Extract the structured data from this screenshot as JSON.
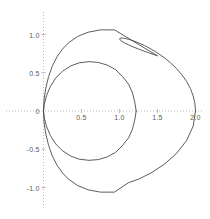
{
  "chart_data": {
    "type": "line",
    "title": "",
    "xlabel": "",
    "ylabel": "",
    "grid": false,
    "legend": "none",
    "axes": {
      "x_axis_style": "dotted",
      "y_axis_style": "dotted",
      "axis_color": "#b9b9b9",
      "curve_color": "#4a4a4a"
    },
    "xlim": [
      -0.22,
      2.18
    ],
    "ylim": [
      -1.25,
      1.3
    ],
    "xticks": [
      0,
      0.5,
      1.0,
      1.5,
      2.0
    ],
    "xticklabels": [
      "0",
      "0.5",
      "1.0",
      "1.5",
      "2.0"
    ],
    "yticks": [
      -1.0,
      -0.5,
      0.5,
      1.0
    ],
    "yticklabels": [
      "-1.0",
      "-0.5",
      "0.5",
      "1.0"
    ],
    "origin_label": "0",
    "series": [
      {
        "name": "outer-cardioid",
        "polar_equation": "r = 1 + cos(theta)",
        "color": "#4a4a4a",
        "x_max": 2.0,
        "y_max": 1.1,
        "y_min": -1.1,
        "points": [
          [
            2.0,
            0.0
          ],
          [
            1.9924,
            0.0995
          ],
          [
            1.9698,
            0.1977
          ],
          [
            1.933,
            0.2934
          ],
          [
            1.883,
            0.3855
          ],
          [
            1.8214,
            0.4729
          ],
          [
            1.75,
            0.5547
          ],
          [
            1.671,
            0.63
          ],
          [
            1.5868,
            0.6982
          ],
          [
            1.5,
            0.7587
          ],
          [
            1.4132,
            0.8112
          ],
          [
            1.329,
            0.8553
          ],
          [
            1.25,
            0.891
          ],
          [
            1.1786,
            0.9185
          ],
          [
            1.117,
            0.9378
          ],
          [
            1.067,
            0.9494
          ],
          [
            1.0302,
            0.9538
          ],
          [
            1.0076,
            0.9515
          ],
          [
            1.0,
            0.9433
          ],
          [
            1.0076,
            0.9298
          ],
          [
            1.0302,
            0.9118
          ],
          [
            1.067,
            0.89
          ],
          [
            1.117,
            0.8653
          ],
          [
            1.1786,
            0.8384
          ],
          [
            1.25,
            0.81
          ],
          [
            1.329,
            0.7807
          ],
          [
            1.4132,
            0.7511
          ],
          [
            1.5,
            0.7216
          ],
          [
            0.933,
            1.0607
          ],
          [
            0.75,
            1.0607
          ],
          [
            0.5868,
            1.0301
          ],
          [
            0.45,
            0.975
          ],
          [
            0.329,
            0.891
          ],
          [
            0.25,
            0.81
          ],
          [
            0.1786,
            0.71
          ],
          [
            0.117,
            0.59
          ],
          [
            0.067,
            0.45
          ],
          [
            0.0302,
            0.3
          ],
          [
            0.0076,
            0.15
          ],
          [
            0.0,
            0.0
          ],
          [
            0.0076,
            -0.15
          ],
          [
            0.0302,
            -0.3
          ],
          [
            0.067,
            -0.45
          ],
          [
            0.117,
            -0.59
          ],
          [
            0.1786,
            -0.71
          ],
          [
            0.25,
            -0.81
          ],
          [
            0.329,
            -0.891
          ],
          [
            0.45,
            -0.975
          ],
          [
            0.5868,
            -1.0301
          ],
          [
            0.75,
            -1.0607
          ],
          [
            0.933,
            -1.0607
          ],
          [
            1.117,
            -0.9378
          ],
          [
            1.25,
            -0.891
          ],
          [
            1.4132,
            -0.8112
          ],
          [
            1.5868,
            -0.6982
          ],
          [
            1.75,
            -0.5547
          ],
          [
            1.883,
            -0.3855
          ],
          [
            1.9698,
            -0.1977
          ],
          [
            2.0,
            0.0
          ]
        ]
      },
      {
        "name": "inner-limacon",
        "polar_equation": "r = 0.6 + 0.6 cos(theta)",
        "color": "#4a4a4a",
        "x_max": 1.22,
        "y_max": 0.64,
        "y_min": -0.64,
        "points": [
          [
            1.22,
            0.0
          ],
          [
            1.2,
            0.12
          ],
          [
            1.17,
            0.24
          ],
          [
            1.12,
            0.35
          ],
          [
            1.04,
            0.45
          ],
          [
            0.95,
            0.54
          ],
          [
            0.84,
            0.6
          ],
          [
            0.72,
            0.635
          ],
          [
            0.6,
            0.645
          ],
          [
            0.47,
            0.63
          ],
          [
            0.36,
            0.59
          ],
          [
            0.25,
            0.52
          ],
          [
            0.16,
            0.43
          ],
          [
            0.09,
            0.32
          ],
          [
            0.04,
            0.2
          ],
          [
            0.01,
            0.09
          ],
          [
            0.0,
            0.0
          ],
          [
            0.01,
            -0.09
          ],
          [
            0.04,
            -0.2
          ],
          [
            0.09,
            -0.32
          ],
          [
            0.16,
            -0.43
          ],
          [
            0.25,
            -0.52
          ],
          [
            0.36,
            -0.59
          ],
          [
            0.47,
            -0.63
          ],
          [
            0.6,
            -0.645
          ],
          [
            0.72,
            -0.635
          ],
          [
            0.84,
            -0.6
          ],
          [
            0.95,
            -0.54
          ],
          [
            1.04,
            -0.45
          ],
          [
            1.12,
            -0.35
          ],
          [
            1.17,
            -0.24
          ],
          [
            1.2,
            -0.12
          ],
          [
            1.22,
            0.0
          ]
        ]
      }
    ]
  }
}
